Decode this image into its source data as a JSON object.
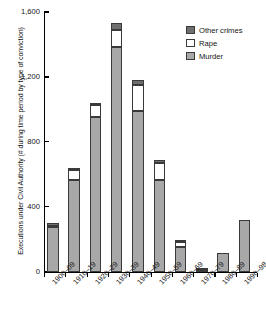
{
  "chart_data": {
    "type": "bar",
    "stacked": true,
    "title": "",
    "xlabel": "",
    "ylabel": "Executions under Civil Authority (# during time period by type of conviction)",
    "ylim": [
      0,
      1600
    ],
    "yticks": [
      0,
      400,
      800,
      1200,
      1600
    ],
    "ytick_labels": [
      "0",
      "400",
      "800",
      "1,200",
      "1,600"
    ],
    "grid": false,
    "legend_position": "top-right",
    "categories": [
      "1900–09",
      "1910–19",
      "1920–29",
      "1930–39",
      "1940–49",
      "1950–59",
      "1960–69",
      "1970–79",
      "1980–89",
      "1990–98"
    ],
    "series": [
      {
        "name": "Murder",
        "color": "#a8a8a8",
        "values": [
          275,
          565,
          955,
          1385,
          990,
          565,
          150,
          8,
          117,
          320
        ]
      },
      {
        "name": "Rape",
        "color": "#ffffff",
        "values": [
          8,
          60,
          70,
          105,
          160,
          105,
          35,
          0,
          0,
          0
        ]
      },
      {
        "name": "Other crimes",
        "color": "#6f6f6f",
        "values": [
          17,
          15,
          15,
          40,
          30,
          15,
          5,
          2,
          0,
          0
        ]
      }
    ],
    "totals": [
      300,
      640,
      1040,
      1530,
      1180,
      685,
      190,
      10,
      117,
      320
    ]
  },
  "legend": {
    "items": [
      {
        "label": "Other crimes",
        "color": "#6f6f6f"
      },
      {
        "label": "Rape",
        "color": "#ffffff"
      },
      {
        "label": "Murder",
        "color": "#a8a8a8"
      }
    ]
  }
}
